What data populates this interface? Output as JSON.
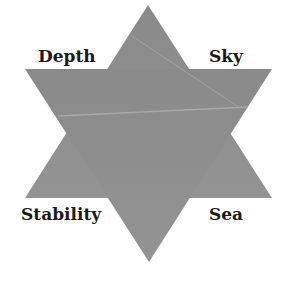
{
  "diagram": {
    "shape": "six-pointed star",
    "fill_color": "#8e8e8e",
    "labels": {
      "top_left": "Depth",
      "top_right": "Sky",
      "bottom_left": "Stability",
      "bottom_right": "Sea"
    }
  }
}
